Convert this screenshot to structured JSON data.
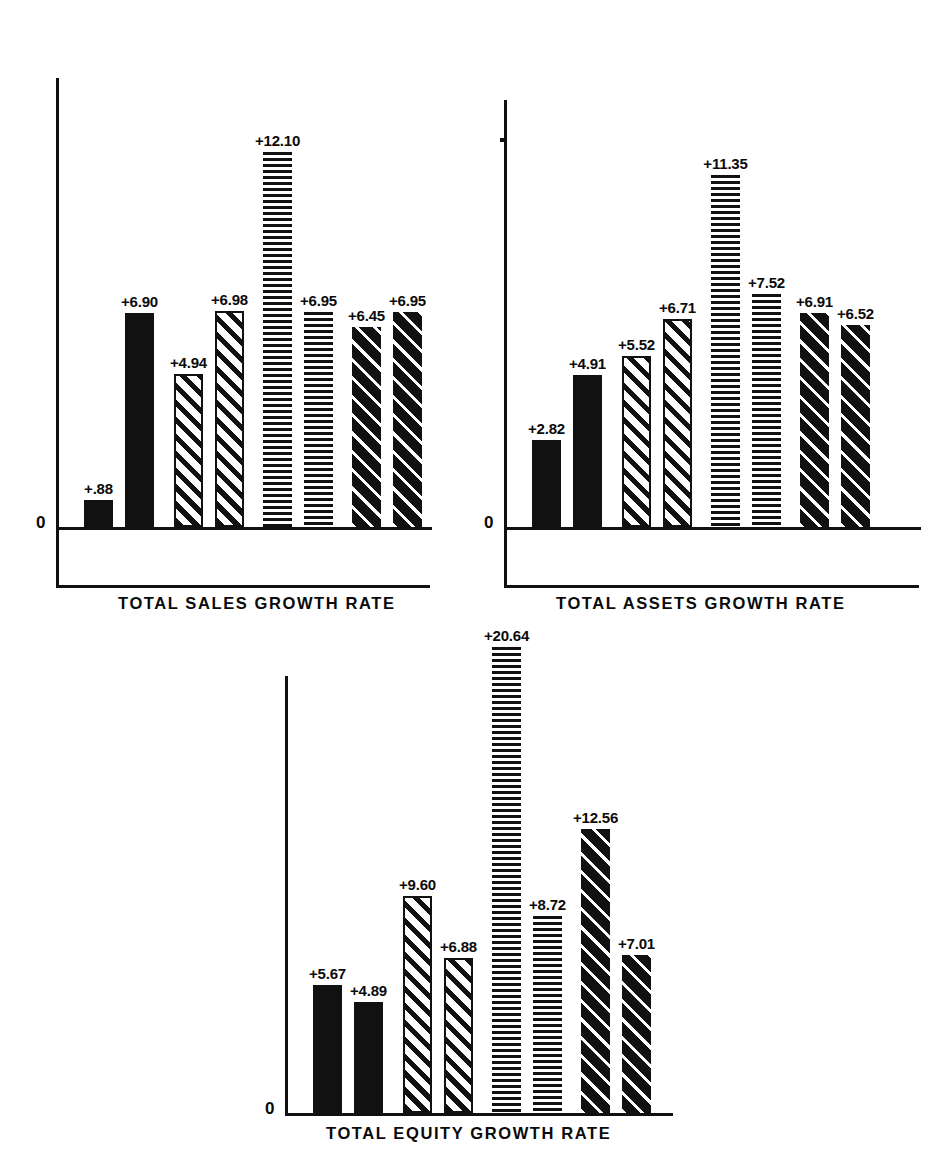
{
  "figure": {
    "background": "#ffffff",
    "ink_color": "#111111",
    "zero_label": "0"
  },
  "chart_data": [
    {
      "type": "bar",
      "title": "TOTAL SALES GROWTH RATE",
      "xlabel": "",
      "ylabel": "",
      "ylim": [
        0,
        14.5
      ],
      "grid": false,
      "legend": "none",
      "categories": [
        "1",
        "2",
        "3",
        "4",
        "5",
        "6",
        "7",
        "8"
      ],
      "values": [
        0.88,
        6.9,
        4.94,
        6.98,
        12.1,
        6.95,
        6.45,
        6.95
      ],
      "data_labels": [
        "+.88",
        "+6.90",
        "+4.94",
        "+6.98",
        "+12.10",
        "+6.95",
        "+6.45",
        "+6.95"
      ],
      "patterns": [
        "solid",
        "solid",
        "diag-light",
        "diag-light",
        "horiz",
        "horiz",
        "diag-dark",
        "diag-dark"
      ]
    },
    {
      "type": "bar",
      "title": "TOTAL ASSETS GROWTH RATE",
      "xlabel": "",
      "ylabel": "",
      "ylim": [
        0,
        14.5
      ],
      "grid": false,
      "legend": "none",
      "categories": [
        "1",
        "2",
        "3",
        "4",
        "5",
        "6",
        "7",
        "8"
      ],
      "values": [
        2.82,
        4.91,
        5.52,
        6.71,
        11.35,
        7.52,
        6.91,
        6.52
      ],
      "data_labels": [
        "+2.82",
        "+4.91",
        "+5.52",
        "+6.71",
        "+11.35",
        "+7.52",
        "+6.91",
        "+6.52"
      ],
      "patterns": [
        "solid",
        "solid",
        "diag-light",
        "diag-light",
        "horiz",
        "horiz",
        "diag-dark",
        "diag-dark"
      ]
    },
    {
      "type": "bar",
      "title": "TOTAL EQUITY GROWTH RATE",
      "xlabel": "",
      "ylabel": "",
      "ylim": [
        0,
        22.5
      ],
      "grid": false,
      "legend": "none",
      "categories": [
        "1",
        "2",
        "3",
        "4",
        "5",
        "6",
        "7",
        "8"
      ],
      "values": [
        5.67,
        4.89,
        9.6,
        6.88,
        20.64,
        8.72,
        12.56,
        7.01
      ],
      "data_labels": [
        "+5.67",
        "+4.89",
        "+9.60",
        "+6.88",
        "+20.64",
        "+8.72",
        "+12.56",
        "+7.01"
      ],
      "patterns": [
        "solid",
        "solid",
        "diag-light",
        "diag-light",
        "horiz",
        "horiz",
        "diag-dark",
        "diag-dark"
      ]
    }
  ],
  "layout": [
    {
      "id": "sales",
      "left": 56,
      "baseline_y": 527,
      "axis_top": 78,
      "axis_right": 432,
      "scale": 31.0,
      "has_frame_box": true,
      "frame_bottom_y": 585,
      "tick": false,
      "title_left": 118,
      "title_top": 595,
      "slots": [
        {
          "x": 28,
          "w": 29,
          "label_dx": 0
        },
        {
          "x": 69,
          "w": 29,
          "label_dx": 0
        },
        {
          "x": 118,
          "w": 29,
          "label_dx": 0
        },
        {
          "x": 159,
          "w": 29,
          "label_dx": 0
        },
        {
          "x": 207,
          "w": 29,
          "label_dx": 0
        },
        {
          "x": 248,
          "w": 29,
          "label_dx": 0
        },
        {
          "x": 296,
          "w": 29,
          "label_dx": 0
        },
        {
          "x": 337,
          "w": 29,
          "label_dx": 0
        }
      ]
    },
    {
      "id": "assets",
      "left": 504,
      "baseline_y": 527,
      "axis_top": 100,
      "axis_right": 921,
      "scale": 31.0,
      "has_frame_box": true,
      "frame_bottom_y": 585,
      "tick": true,
      "tick_y": 138,
      "title_left": 556,
      "title_top": 595,
      "slots": [
        {
          "x": 28,
          "w": 29,
          "label_dx": 0
        },
        {
          "x": 69,
          "w": 29,
          "label_dx": 0
        },
        {
          "x": 118,
          "w": 29,
          "label_dx": 0
        },
        {
          "x": 159,
          "w": 29,
          "label_dx": 0
        },
        {
          "x": 207,
          "w": 29,
          "label_dx": 0
        },
        {
          "x": 248,
          "w": 29,
          "label_dx": 0
        },
        {
          "x": 296,
          "w": 29,
          "label_dx": 0
        },
        {
          "x": 337,
          "w": 29,
          "label_dx": 0
        }
      ]
    },
    {
      "id": "equity",
      "left": 285,
      "baseline_y": 1113,
      "axis_top": 676,
      "axis_right": 673,
      "scale": 22.6,
      "has_frame_box": false,
      "frame_bottom_y": 0,
      "tick": false,
      "title_left": 326,
      "title_top": 1125,
      "slots": [
        {
          "x": 28,
          "w": 29,
          "label_dx": 0
        },
        {
          "x": 69,
          "w": 29,
          "label_dx": 0
        },
        {
          "x": 118,
          "w": 29,
          "label_dx": 0
        },
        {
          "x": 159,
          "w": 29,
          "label_dx": 0
        },
        {
          "x": 207,
          "w": 29,
          "label_dx": 0
        },
        {
          "x": 248,
          "w": 29,
          "label_dx": 0
        },
        {
          "x": 296,
          "w": 29,
          "label_dx": 0
        },
        {
          "x": 337,
          "w": 29,
          "label_dx": 0
        }
      ]
    }
  ]
}
